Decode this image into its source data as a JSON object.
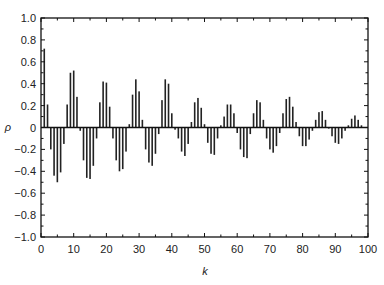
{
  "chart_data": {
    "type": "bar",
    "title": "",
    "xlabel": "k",
    "ylabel": "ρ",
    "xlim": [
      0,
      100
    ],
    "ylim": [
      -1.0,
      1.0
    ],
    "grid": false,
    "legend": null,
    "x_ticks": [
      "0",
      "10",
      "20",
      "30",
      "40",
      "50",
      "60",
      "70",
      "80",
      "90",
      "100"
    ],
    "y_ticks": [
      "1.0",
      "0.8",
      "0.6",
      "0.4",
      "0.2",
      "0",
      "−0.2",
      "−0.4",
      "−0.6",
      "−0.8",
      "−1.0"
    ],
    "x": [
      1,
      2,
      3,
      4,
      5,
      6,
      7,
      8,
      9,
      10,
      11,
      12,
      13,
      14,
      15,
      16,
      17,
      18,
      19,
      20,
      21,
      22,
      23,
      24,
      25,
      26,
      27,
      28,
      29,
      30,
      31,
      32,
      33,
      34,
      35,
      36,
      37,
      38,
      39,
      40,
      41,
      42,
      43,
      44,
      45,
      46,
      47,
      48,
      49,
      50,
      51,
      52,
      53,
      54,
      55,
      56,
      57,
      58,
      59,
      60,
      61,
      62,
      63,
      64,
      65,
      66,
      67,
      68,
      69,
      70,
      71,
      72,
      73,
      74,
      75,
      76,
      77,
      78,
      79,
      80,
      81,
      82,
      83,
      84,
      85,
      86,
      87,
      88,
      89,
      90,
      91,
      92,
      93,
      94,
      95,
      96,
      97,
      98
    ],
    "values": [
      0.72,
      0.21,
      -0.2,
      -0.44,
      -0.5,
      -0.41,
      -0.15,
      0.21,
      0.5,
      0.52,
      0.28,
      -0.03,
      -0.3,
      -0.46,
      -0.47,
      -0.35,
      -0.1,
      0.23,
      0.42,
      0.41,
      0.19,
      -0.1,
      -0.3,
      -0.4,
      -0.38,
      -0.22,
      0.03,
      0.3,
      0.44,
      0.33,
      0.07,
      -0.2,
      -0.32,
      -0.35,
      -0.24,
      -0.06,
      0.25,
      0.44,
      0.4,
      0.13,
      -0.02,
      -0.1,
      -0.22,
      -0.26,
      -0.15,
      0.05,
      0.23,
      0.27,
      0.18,
      0.03,
      -0.14,
      -0.24,
      -0.25,
      -0.1,
      0.02,
      0.1,
      0.21,
      0.21,
      0.13,
      -0.05,
      -0.2,
      -0.27,
      -0.28,
      -0.06,
      0.13,
      0.25,
      0.23,
      0.07,
      -0.1,
      -0.2,
      -0.23,
      -0.17,
      -0.05,
      0.13,
      0.26,
      0.28,
      0.19,
      0.05,
      -0.08,
      -0.17,
      -0.17,
      -0.11,
      -0.03,
      0.07,
      0.14,
      0.15,
      0.07,
      -0.01,
      -0.08,
      -0.14,
      -0.15,
      -0.1,
      -0.03,
      0.02,
      0.08,
      0.11,
      0.07,
      0.02
    ],
    "bar_color": "#222222"
  }
}
